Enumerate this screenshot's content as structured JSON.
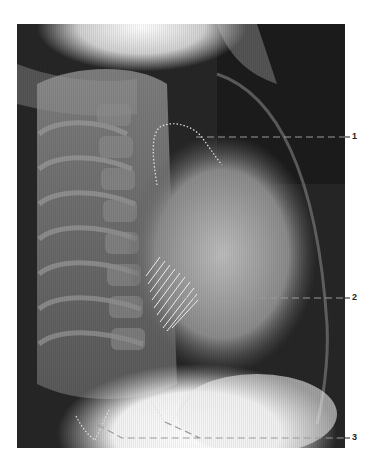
{
  "figure": {
    "type": "lateral chest radiograph",
    "annotations": [
      {
        "id": "label-1",
        "text": "1",
        "target": "dotted outline, upper cardiac contour"
      },
      {
        "id": "label-2",
        "text": "2",
        "target": "hatched region, posterior cardiac area"
      },
      {
        "id": "label-3",
        "text": "3",
        "target": "dotted lines at diaphragm / costophrenic angles"
      }
    ],
    "colors": {
      "background": "#ffffff",
      "annotation_line": "#9a9a9a",
      "annotation_mark": "#e8e8e8",
      "label_text": "#222222"
    }
  }
}
